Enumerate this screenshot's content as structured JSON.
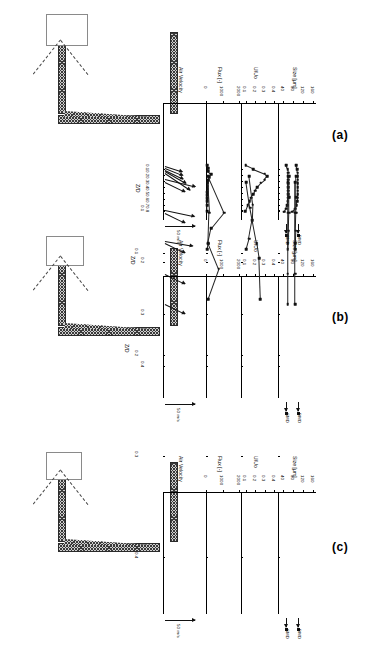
{
  "figure": {
    "orientation": "rotated-90",
    "panels": [
      {
        "tag": "(a)",
        "ordinate_label": "Z/D",
        "ordinate_ticks": [
          "0.1",
          "0.2",
          "0.3",
          "0.4",
          "0.5",
          "0.6",
          "0.7",
          "0.8"
        ],
        "scale_label": "50 m/s",
        "marker_labels": [
          "SMD",
          "DMD"
        ],
        "charts": [
          {
            "title": "Air Velocity",
            "type": "vector",
            "xlabel": "Air Velocity",
            "ylabel": "Z/D",
            "vectors": [
              {
                "z": 0.05,
                "angle_deg": 18,
                "length": 0.3
              },
              {
                "z": 0.08,
                "angle_deg": 22,
                "length": 0.34
              },
              {
                "z": 0.11,
                "angle_deg": 26,
                "length": 0.38
              },
              {
                "z": 0.14,
                "angle_deg": 30,
                "length": 0.55
              },
              {
                "z": 0.17,
                "angle_deg": 34,
                "length": 0.75
              }
            ]
          },
          {
            "title": "Flux [-]",
            "type": "line",
            "xlabel": "Flux [-]",
            "ylabel": "Z/D",
            "xticks": [
              0,
              1000,
              2000
            ],
            "xlim": [
              0,
              2000
            ],
            "ylim": [
              0,
              0.85
            ],
            "x": [
              60,
              140,
              150,
              300,
              180,
              120,
              110,
              100,
              95,
              90,
              88,
              85,
              80,
              75,
              70
            ],
            "y": [
              0.04,
              0.09,
              0.14,
              0.19,
              0.24,
              0.29,
              0.34,
              0.39,
              0.44,
              0.49,
              0.54,
              0.59,
              0.64,
              0.7,
              0.8
            ]
          },
          {
            "title": "U/Uo",
            "type": "line",
            "xlabel": "U/Uo",
            "ylabel": "Z/D",
            "xticks": [
              0.1,
              0.2,
              0.3,
              0.4
            ],
            "xlim": [
              0.05,
              0.42
            ],
            "ylim": [
              0,
              0.85
            ],
            "x": [
              0.1,
              0.18,
              0.3,
              0.33,
              0.3,
              0.26,
              0.22,
              0.2,
              0.18,
              0.16,
              0.14,
              0.12,
              0.095
            ],
            "y": [
              0.04,
              0.1,
              0.175,
              0.22,
              0.28,
              0.33,
              0.4,
              0.46,
              0.52,
              0.58,
              0.64,
              0.7,
              0.8
            ]
          },
          {
            "title": "Size [µm]",
            "type": "scatter",
            "xlabel": "Size [µm]",
            "ylabel": "Z/D",
            "xticks": [
              40,
              80,
              120,
              160
            ],
            "xlim": [
              20,
              170
            ],
            "ylim": [
              0,
              0.85
            ],
            "series": [
              {
                "name": "SMD",
                "x": [
                  52,
                  58,
                  60,
                  60,
                  60,
                  60,
                  60,
                  60,
                  60,
                  60,
                  58,
                  56,
                  52,
                  44
                ],
                "y": [
                  0.04,
                  0.1,
                  0.16,
                  0.22,
                  0.28,
                  0.34,
                  0.4,
                  0.46,
                  0.52,
                  0.58,
                  0.64,
                  0.7,
                  0.76,
                  0.81
                ]
              },
              {
                "name": "DMD",
                "x": [
                  92,
                  96,
                  98,
                  98,
                  98,
                  98,
                  98,
                  98,
                  98,
                  98,
                  96,
                  94,
                  88,
                  76
                ],
                "y": [
                  0.04,
                  0.1,
                  0.16,
                  0.22,
                  0.28,
                  0.34,
                  0.4,
                  0.46,
                  0.52,
                  0.58,
                  0.64,
                  0.7,
                  0.76,
                  0.81
                ]
              }
            ]
          }
        ]
      },
      {
        "tag": "(b)",
        "ordinate_label": "Z/D",
        "ordinate_ticks": [
          "0.1",
          "0.2",
          "0.3",
          "0.4"
        ],
        "scale_label": "50 m/s",
        "marker_labels": [
          "SMD",
          "DMD"
        ],
        "charts": [
          {
            "title": "Air Velocity",
            "type": "vector",
            "xlabel": "Air Velocity",
            "ylabel": "Z/D",
            "vectors": [
              {
                "z": 0.04,
                "angle_deg": 14,
                "length": 0.8
              },
              {
                "z": 0.1,
                "angle_deg": 12,
                "length": 0.78
              },
              {
                "z": 0.16,
                "angle_deg": 10,
                "length": 0.7
              }
            ]
          },
          {
            "title": "Flux [-]",
            "type": "line",
            "xlabel": "Flux [-]",
            "ylabel": "Z/D",
            "xticks": [
              0,
              1000,
              2000
            ],
            "xlim": [
              0,
              2000
            ],
            "ylim": [
              0,
              0.45
            ],
            "x": [
              130,
              1100,
              330,
              130,
              90
            ],
            "y": [
              0.035,
              0.105,
              0.135,
              0.165,
              0.175
            ]
          },
          {
            "title": "U/Uo",
            "type": "line",
            "xlabel": "U/Uo",
            "ylabel": "Z/D",
            "xticks": [
              0.1,
              0.2,
              0.3,
              0.4
            ],
            "xlim": [
              0.05,
              0.42
            ],
            "ylim": [
              0,
              0.45
            ],
            "x": [
              0.135,
              0.175,
              0.17,
              0.135,
              0.105
            ],
            "y": [
              0.035,
              0.09,
              0.12,
              0.155,
              0.175
            ]
          },
          {
            "title": "Size [µm]",
            "type": "scatter",
            "xlabel": "Size [µm]",
            "ylabel": "Z/D",
            "xticks": [
              40,
              80,
              120,
              160
            ],
            "xlim": [
              20,
              170
            ],
            "ylim": [
              0,
              0.45
            ],
            "series": [
              {
                "name": "SMD",
                "x": [
                  64,
                  64,
                  64,
                  62,
                  58
                ],
                "y": [
                  0.035,
                  0.075,
                  0.105,
                  0.14,
                  0.175
                ]
              },
              {
                "name": "DMD",
                "x": [
                  92,
                  92,
                  92,
                  90,
                  88
                ],
                "y": [
                  0.035,
                  0.075,
                  0.105,
                  0.14,
                  0.175
                ]
              }
            ]
          }
        ]
      },
      {
        "tag": "(c)",
        "ordinate_label": "Z/D",
        "ordinate_ticks": [
          "0.1",
          "0.2",
          "0.3",
          "0.4"
        ],
        "scale_label": "50 m/s",
        "marker_labels": [
          "SMD",
          "DMD"
        ],
        "charts": [
          {
            "title": "Air Velocity",
            "type": "vector",
            "xlabel": "Air Velocity",
            "ylabel": "Z/D",
            "vectors": [
              {
                "z": 0.03,
                "angle_deg": 26,
                "length": 0.45
              },
              {
                "z": 0.06,
                "angle_deg": 26,
                "length": 0.45
              },
              {
                "z": 0.09,
                "angle_deg": 26,
                "length": 0.45
              },
              {
                "z": 0.12,
                "angle_deg": 26,
                "length": 0.45
              },
              {
                "z": 0.15,
                "angle_deg": 26,
                "length": 0.45
              }
            ]
          },
          {
            "title": "Flux [-]",
            "type": "line",
            "xlabel": "Flux [-]",
            "ylabel": "Z/D",
            "xticks": [
              0,
              1000,
              2000
            ],
            "xlim": [
              0,
              2000
            ],
            "ylim": [
              0,
              0.45
            ],
            "x": [
              110,
              210,
              150,
              780,
              120
            ],
            "y": [
              0.03,
              0.06,
              0.09,
              0.115,
              0.145
            ]
          },
          {
            "title": "U/Uo",
            "type": "line",
            "xlabel": "U/Uo",
            "ylabel": "Z/D",
            "xticks": [
              0.1,
              0.2,
              0.3,
              0.4
            ],
            "xlim": [
              0.05,
              0.42
            ],
            "ylim": [
              0,
              0.45
            ],
            "x": [
              0.105,
              0.145,
              0.215,
              0.24,
              0.255
            ],
            "y": [
              0.03,
              0.055,
              0.09,
              0.105,
              0.145
            ]
          },
          {
            "title": "Size [µm]",
            "type": "scatter",
            "xlabel": "Size [µm]",
            "ylabel": "Z/D",
            "xticks": [
              40,
              80,
              120,
              160
            ],
            "xlim": [
              20,
              170
            ],
            "ylim": [
              0,
              0.45
            ],
            "series": [
              {
                "name": "SMD",
                "x": [
                  58,
                  58,
                  58,
                  58,
                  58
                ],
                "y": [
                  0.03,
                  0.06,
                  0.09,
                  0.12,
                  0.15
                ]
              },
              {
                "name": "DMD",
                "x": [
                  88,
                  88,
                  88,
                  88,
                  88
                ],
                "y": [
                  0.03,
                  0.06,
                  0.09,
                  0.12,
                  0.15
                ]
              }
            ]
          }
        ]
      }
    ]
  }
}
